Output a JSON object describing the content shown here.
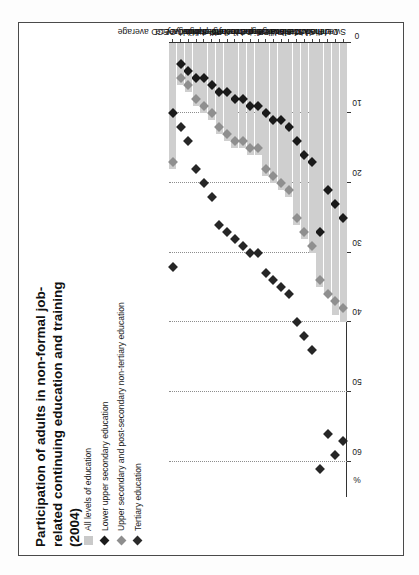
{
  "figure": {
    "title": "Participation of adults in non-formal job-related continuing education and training (2004)",
    "axis_unit": "%"
  },
  "legend": {
    "items": [
      {
        "label": "All levels of education",
        "marker": "square",
        "color": "#c9c9c9"
      },
      {
        "label": "Lower upper secondary education",
        "marker": "diamond",
        "color": "#1b1b1b"
      },
      {
        "label": "Upper secondary and post-secondary non-tertiary education",
        "marker": "diamond",
        "color": "#8e8e8e"
      },
      {
        "label": "Tertiary education",
        "marker": "diamond",
        "color": "#2b2b2b"
      }
    ]
  },
  "chart_data": {
    "type": "bar",
    "title": "Participation of adults in non-formal job-related continuing education and training (2004)",
    "xlabel": "",
    "ylabel": "%",
    "xlim": [
      0,
      65
    ],
    "grid": true,
    "orientation": "horizontal",
    "legend_position": "top-left",
    "tick_labels": [
      "0",
      "10",
      "20",
      "30",
      "40",
      "50",
      "60"
    ],
    "tick_values": [
      0,
      10,
      20,
      30,
      40,
      50,
      60
    ],
    "categories": [
      "Sweden",
      "Denmark",
      "United States",
      "Finland",
      "Switzerland",
      "United Kingdom",
      "Canada",
      "Slovak Republic",
      "France",
      "Austria",
      "Belgium",
      "Luxembourg",
      "Germany",
      "Czech Republic",
      "Ireland",
      "Netherlands",
      "Poland",
      "Portugal",
      "Spain",
      "Hungary",
      "Italy",
      "Greece",
      "OECD average"
    ],
    "series": [
      {
        "name": "All levels of education",
        "marker": "bar",
        "color": "#cfcfcf",
        "values": [
          40,
          39,
          36,
          35,
          30,
          28,
          26,
          22,
          21,
          20,
          19,
          16,
          16,
          15,
          15,
          14,
          13,
          11,
          10,
          9,
          7,
          6,
          18
        ]
      },
      {
        "name": "Lower upper secondary education",
        "marker": "diamond",
        "color": "#1a1a1a",
        "values": [
          25,
          23,
          21,
          27,
          17,
          16,
          14,
          12,
          11,
          11,
          10,
          9,
          9,
          8,
          8,
          7,
          7,
          6,
          5,
          5,
          4,
          3,
          10
        ]
      },
      {
        "name": "Upper secondary and post-secondary non-tertiary education",
        "marker": "diamond",
        "color": "#8f8f8f",
        "values": [
          38,
          37,
          36,
          34,
          29,
          27,
          25,
          21,
          20,
          19,
          18,
          15,
          15,
          14,
          14,
          13,
          12,
          10,
          9,
          8,
          6,
          5,
          17
        ]
      },
      {
        "name": "Tertiary education",
        "marker": "diamond",
        "color": "#262626",
        "values": [
          57,
          59,
          56,
          61,
          44,
          42,
          40,
          36,
          35,
          34,
          33,
          30,
          30,
          29,
          28,
          27,
          26,
          22,
          20,
          18,
          14,
          12,
          32
        ]
      }
    ]
  }
}
